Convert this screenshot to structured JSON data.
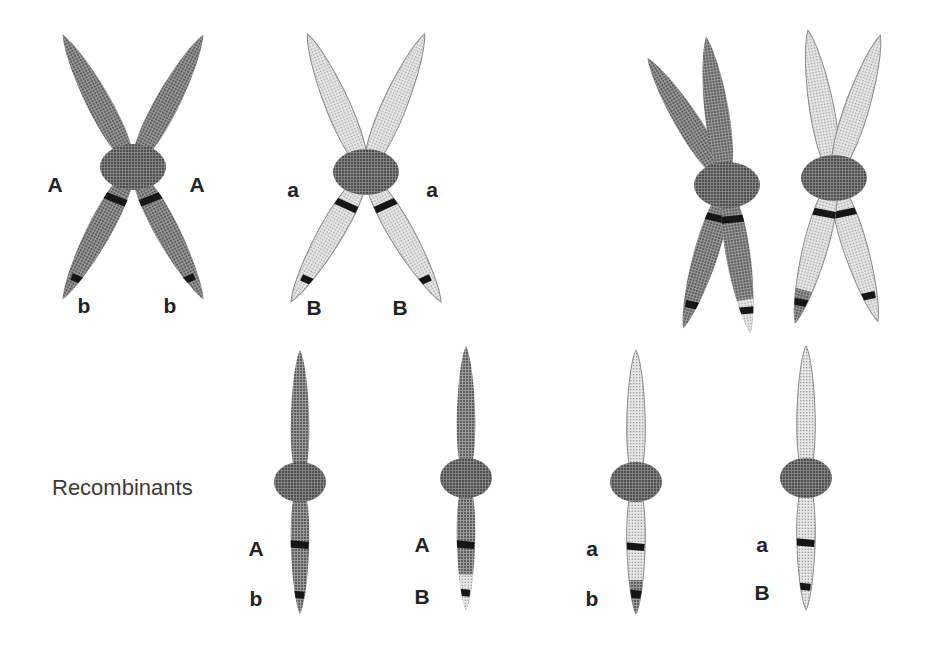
{
  "figure": {
    "background": "#ffffff",
    "width": 934,
    "height": 653
  },
  "colors": {
    "dark_chromatid": "#7d7d7d",
    "light_chromatid": "#d2d2d2",
    "centromere_dark": "#6e6e6e",
    "centromere_light": "#6e6e6e",
    "band": "#161616",
    "outline_light": "#8a8a8a",
    "label_text": "#232323",
    "section_text": "#3a3a3a"
  },
  "labels": {
    "recombinants": "Recombinants"
  },
  "top_row": {
    "groups": [
      {
        "id": "dominant-pair",
        "name": "homologous-pair-AAbb",
        "shade": "dark",
        "center": {
          "x": 133,
          "y": 167
        },
        "upper_allele": "A",
        "lower_allele": "b",
        "upper_labels": [
          {
            "text": "A",
            "x": 55,
            "y": 192
          },
          {
            "text": "A",
            "x": 197,
            "y": 192
          }
        ],
        "lower_labels": [
          {
            "text": "b",
            "x": 84,
            "y": 313
          },
          {
            "text": "b",
            "x": 170,
            "y": 313
          }
        ]
      },
      {
        "id": "recessive-pair",
        "name": "homologous-pair-aaBB",
        "shade": "light",
        "center": {
          "x": 366,
          "y": 172
        },
        "upper_allele": "a",
        "lower_allele": "B",
        "upper_labels": [
          {
            "text": "a",
            "x": 293,
            "y": 197
          },
          {
            "text": "a",
            "x": 432,
            "y": 197
          }
        ],
        "lower_labels": [
          {
            "text": "B",
            "x": 314,
            "y": 315
          },
          {
            "text": "B",
            "x": 400,
            "y": 315
          }
        ]
      }
    ],
    "crossover": {
      "id": "crossover-pair",
      "name": "crossing-over-bivalent",
      "dark_center": {
        "x": 727,
        "y": 185
      },
      "light_center": {
        "x": 834,
        "y": 178
      },
      "description": "chiasma with exchanged chromatid tips"
    }
  },
  "recombinant_row": {
    "label": "Recombinants",
    "label_pos": {
      "x": 52,
      "y": 495
    },
    "chromosomes": [
      {
        "id": "recombinant-1",
        "name": "chromosome-A-b",
        "x": 300,
        "body_shade": "dark",
        "tip_shade": "dark",
        "tip_swapped": false,
        "upper_allele": "A",
        "lower_allele": "b",
        "label_x": 256
      },
      {
        "id": "recombinant-2",
        "name": "chromosome-A-B",
        "x": 466,
        "body_shade": "dark",
        "tip_shade": "light",
        "tip_swapped": true,
        "upper_allele": "A",
        "lower_allele": "B",
        "label_x": 422
      },
      {
        "id": "recombinant-3",
        "name": "chromosome-a-b",
        "x": 636,
        "body_shade": "light",
        "tip_shade": "dark",
        "tip_swapped": true,
        "upper_allele": "a",
        "lower_allele": "b",
        "label_x": 592
      },
      {
        "id": "recombinant-4",
        "name": "chromosome-a-B",
        "x": 806,
        "body_shade": "light",
        "tip_shade": "light",
        "tip_swapped": false,
        "upper_allele": "a",
        "lower_allele": "B",
        "label_x": 762
      }
    ]
  }
}
